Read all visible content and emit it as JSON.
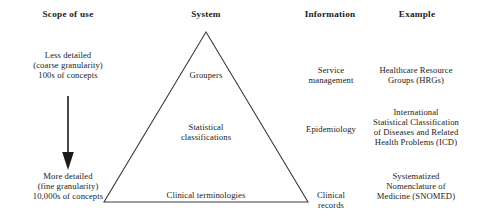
{
  "figure": {
    "background_color": "#ffffff",
    "line_color": "#3c3c3c",
    "text_color": "#1a1a1a"
  },
  "headers": {
    "scope": "Scope of use",
    "system": "System",
    "information": "Information",
    "example": "Example"
  },
  "scope_column": {
    "top_label": "Less detailed\n(coarse granularity)\n100s of concepts",
    "bottom_label": "More detailed\n(fine granularity)\n10,000s of concepts",
    "arrow": "downward-arrow"
  },
  "system_column": {
    "shape": "triangle",
    "tiers": [
      {
        "label": "Groupers"
      },
      {
        "label": "Statistical\nclassifications"
      },
      {
        "label": "Clinical terminologies"
      }
    ]
  },
  "information_column": {
    "tiers": [
      {
        "label": "Service\nmanagement"
      },
      {
        "label": "Epidemiology"
      },
      {
        "label": "Clinical\nrecords"
      }
    ]
  },
  "example_column": {
    "tiers": [
      {
        "label": "Healthcare Resource\nGroups (HRGs)"
      },
      {
        "label": "International\nStatistical Classification\nof Diseases and Related\nHealth Problems (ICD)"
      },
      {
        "label": "Systematized\nNomenclature of\nMedicine (SNOMED)"
      }
    ]
  }
}
